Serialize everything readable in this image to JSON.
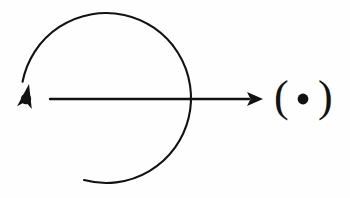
{
  "figure": {
    "background_color": "#fefefe",
    "ink_color": "#121212",
    "width": 350,
    "height": 198,
    "elements": {
      "source_point": {
        "name": "filled dot",
        "cx": 26,
        "cy": 99,
        "r": 5.2
      },
      "rotation_arc": {
        "name": "counterclockwise circular arrow",
        "center_x": 106,
        "center_y": 98,
        "radius": 85,
        "stroke_width": 2.1,
        "direction": "counterclockwise",
        "arrowhead_tip_x": 29,
        "arrowhead_tip_y": 84
      },
      "translation_arrow": {
        "name": "horizontal arrow pointing right",
        "x1": 50,
        "y1": 99,
        "x2": 263,
        "y2": 99,
        "stroke_width": 2.4,
        "arrowhead_length": 16,
        "arrowhead_half_width": 7
      },
      "paren_left": {
        "glyph": "(",
        "x": 281,
        "y": 99
      },
      "target_point": {
        "name": "filled dot inside parentheses",
        "cx": 303,
        "cy": 99,
        "r": 5.4
      },
      "paren_right": {
        "glyph": ")",
        "x": 325,
        "y": 99
      }
    }
  }
}
